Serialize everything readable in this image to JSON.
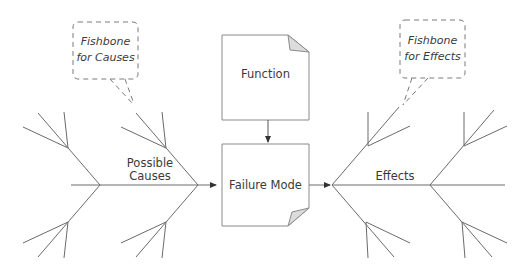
{
  "diagram": {
    "type": "fishbone",
    "callouts": {
      "causes": {
        "line1": "Fishbone",
        "line2": "for Causes"
      },
      "effects": {
        "line1": "Fishbone",
        "line2": "for Effects"
      }
    },
    "boxes": {
      "function": "Function",
      "failure_mode": "Failure Mode"
    },
    "spine_labels": {
      "causes": {
        "line1": "Possible",
        "line2": "Causes"
      },
      "effects": "Effects"
    },
    "colors": {
      "line": "#5a5a5a",
      "box_border": "#8a8a8a",
      "fold_fill": "#dcdcdc",
      "text": "#3a3a3a"
    },
    "edges": [
      {
        "from": "function",
        "to": "failure_mode"
      },
      {
        "from": "possible_causes",
        "to": "failure_mode"
      },
      {
        "from": "failure_mode",
        "to": "effects"
      }
    ]
  }
}
